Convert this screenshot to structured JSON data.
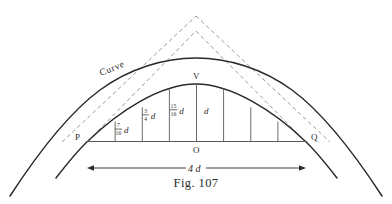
{
  "figure": {
    "caption": "Fig. 107",
    "labels": {
      "curve": "Curve",
      "vertex": "V",
      "origin": "O",
      "left_point": "P",
      "right_point": "Q",
      "span": "4",
      "span_unit": "d"
    },
    "ordinate_labels": [
      {
        "numerator": "7",
        "denominator": "16",
        "unit": "d"
      },
      {
        "numerator": "3",
        "denominator": "4",
        "unit": "d"
      },
      {
        "numerator": "15",
        "denominator": "16",
        "unit": "d"
      },
      {
        "numerator": "",
        "denominator": "",
        "unit": "d"
      }
    ],
    "colors": {
      "solid_line": "#2b2b2b",
      "thin_line": "#5a5a5a",
      "dashed_line": "#9a9a9a",
      "background": "#ffffff",
      "text": "#2b2b2b"
    },
    "geometry": {
      "baseline_y": 141,
      "left_x": 88,
      "right_x": 305,
      "center_x": 196,
      "vertex_y": 84,
      "outer_vertex_y": 58,
      "bays": 8,
      "dimension_value": "4d"
    }
  }
}
